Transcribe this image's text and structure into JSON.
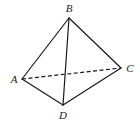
{
  "diagram": {
    "type": "tetrahedron",
    "vertices": [
      {
        "id": "A",
        "label": "A",
        "x": 22,
        "y": 79,
        "lx": 14,
        "ly": 83
      },
      {
        "id": "B",
        "label": "B",
        "x": 69,
        "y": 18,
        "lx": 69,
        "ly": 12
      },
      {
        "id": "C",
        "label": "C",
        "x": 121,
        "y": 68,
        "lx": 130,
        "ly": 72
      },
      {
        "id": "D",
        "label": "D",
        "x": 63,
        "y": 105,
        "lx": 63,
        "ly": 119
      }
    ],
    "edges": [
      {
        "from": "A",
        "to": "B",
        "style": "solid"
      },
      {
        "from": "B",
        "to": "C",
        "style": "solid"
      },
      {
        "from": "B",
        "to": "D",
        "style": "solid"
      },
      {
        "from": "A",
        "to": "D",
        "style": "solid"
      },
      {
        "from": "D",
        "to": "C",
        "style": "solid"
      },
      {
        "from": "A",
        "to": "C",
        "style": "dashed"
      }
    ]
  }
}
